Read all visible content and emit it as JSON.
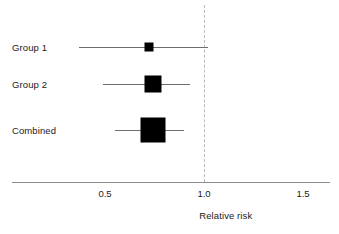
{
  "chart_data": {
    "type": "forest",
    "title": "",
    "xlabel": "Relative risk",
    "ylabel": "",
    "xlim": [
      0.25,
      1.65
    ],
    "xticks": [
      0.5,
      1.0,
      1.5
    ],
    "xtick_labels": [
      "0.5",
      "1.0",
      "1.5"
    ],
    "grid": false,
    "legend": "none",
    "reference_line": 1.0,
    "reference_line_style": "dashed",
    "measure": "Relative risk",
    "rows": [
      {
        "label": "Group 1",
        "estimate": 0.72,
        "ci_low": 0.37,
        "ci_high": 1.02,
        "weight": 0.18,
        "marker_size_px": 9
      },
      {
        "label": "Group 2",
        "estimate": 0.74,
        "ci_low": 0.49,
        "ci_high": 0.93,
        "weight": 0.38,
        "marker_size_px": 17
      },
      {
        "label": "Combined",
        "estimate": 0.74,
        "ci_low": 0.55,
        "ci_high": 0.9,
        "weight": 1.0,
        "marker_size_px": 25
      }
    ]
  },
  "axis": {
    "title": "Relative risk",
    "ticks": [
      {
        "value": "0.5"
      },
      {
        "value": "1.0"
      },
      {
        "value": "1.5"
      }
    ]
  },
  "rows": [
    {
      "label": "Group 1"
    },
    {
      "label": "Group 2"
    },
    {
      "label": "Combined"
    }
  ]
}
